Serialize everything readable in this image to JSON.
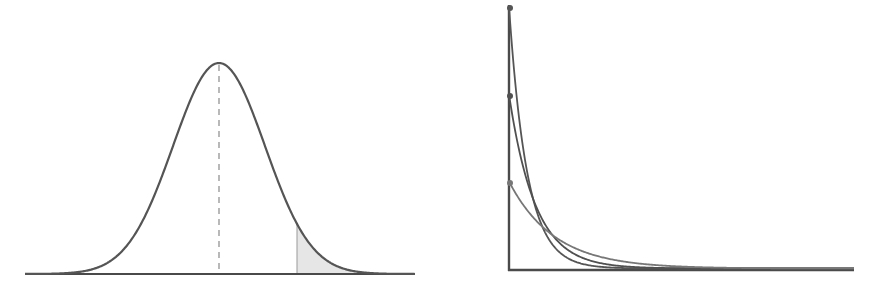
{
  "figure": {
    "background": "#ffffff",
    "stroke_color": "#555555",
    "axis_color": "#4a4a4a",
    "dashed_color": "#8a8a8a",
    "shade_color": "#e6e6e6"
  },
  "normal_panel": {
    "name": "normal-distribution-curve",
    "baseline": {
      "x1": 25,
      "x2": 415,
      "y": 274
    },
    "mean_x": 219,
    "peak_y": 63,
    "sigma_px": 46,
    "shaded_tail_start_x": 297,
    "mean_line": "dashed"
  },
  "exponential_panel": {
    "name": "exponential-decay-curves",
    "origin": {
      "x": 509,
      "y": 270
    },
    "y_axis_top": 5,
    "x_axis_right": 854,
    "curves": [
      {
        "name": "curve-high-rate",
        "start_y": 8,
        "rate": 0.055,
        "color": "#555555"
      },
      {
        "name": "curve-mid-rate",
        "start_y": 96,
        "rate": 0.038,
        "color": "#505050"
      },
      {
        "name": "curve-low-rate",
        "start_y": 183,
        "rate": 0.022,
        "color": "#777777"
      }
    ]
  }
}
